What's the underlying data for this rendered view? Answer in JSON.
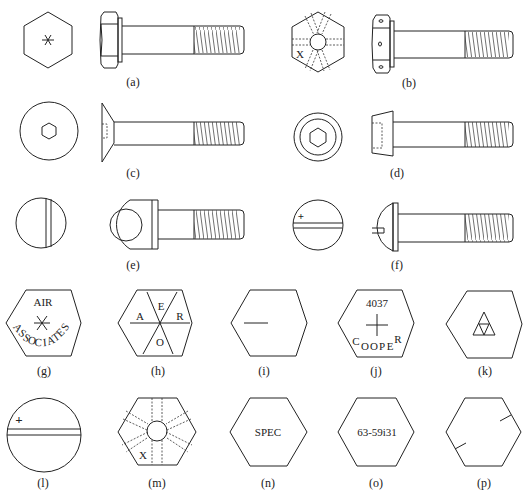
{
  "figure": {
    "labels": {
      "a": "(a)",
      "b": "(b)",
      "c": "(c)",
      "d": "(d)",
      "e": "(e)",
      "f": "(f)",
      "g": "(g)",
      "h": "(h)",
      "i": "(i)",
      "j": "(j)",
      "k": "(k)",
      "l": "(l)",
      "m": "(m)",
      "n": "(n)",
      "o": "(o)",
      "p": "(p)"
    },
    "markings": {
      "b_x": "X",
      "g_top": "AIR",
      "g_arc": [
        "A",
        "S",
        "S",
        "O",
        "C",
        "I",
        "A",
        "T",
        "E",
        "S"
      ],
      "h_letters": {
        "top": "E",
        "left": "A",
        "right": "R",
        "bottom": "O"
      },
      "j_number": "4037",
      "j_bottom": [
        "C",
        "O",
        "O",
        "P",
        "E",
        "R"
      ],
      "l_plus": "+",
      "f_plus": "+",
      "m_x": "X",
      "n_text": "SPEC",
      "o_text": "63-59i31"
    }
  },
  "items": [
    {
      "id": "a",
      "head_view": "hexagon with six-point star mark",
      "side_view": "hex head bolt"
    },
    {
      "id": "b",
      "head_view": "drilled hexagon head with X mark",
      "side_view": "drilled hex head bolt"
    },
    {
      "id": "c",
      "head_view": "circle with hex socket",
      "side_view": "countersunk flat head screw"
    },
    {
      "id": "d",
      "head_view": "double circle with hex socket",
      "side_view": "socket head cap screw"
    },
    {
      "id": "e",
      "head_view": "circle with slot",
      "side_view": "eye bolt"
    },
    {
      "id": "f",
      "head_view": "circle with slot and plus mark",
      "side_view": "round head slotted bolt"
    },
    {
      "id": "g",
      "head_view": "hexagon AIR ASSOCIATES"
    },
    {
      "id": "h",
      "head_view": "hexagon AERO"
    },
    {
      "id": "i",
      "head_view": "hexagon single dash"
    },
    {
      "id": "j",
      "head_view": "hexagon 4037 COOPER"
    },
    {
      "id": "k",
      "head_view": "hexagon triangle mark"
    },
    {
      "id": "l",
      "head_view": "circle slot with plus"
    },
    {
      "id": "m",
      "head_view": "drilled hexagon X"
    },
    {
      "id": "n",
      "head_view": "hexagon SPEC"
    },
    {
      "id": "o",
      "head_view": "hexagon 63-59i31"
    },
    {
      "id": "p",
      "head_view": "hexagon with two tick marks"
    }
  ]
}
